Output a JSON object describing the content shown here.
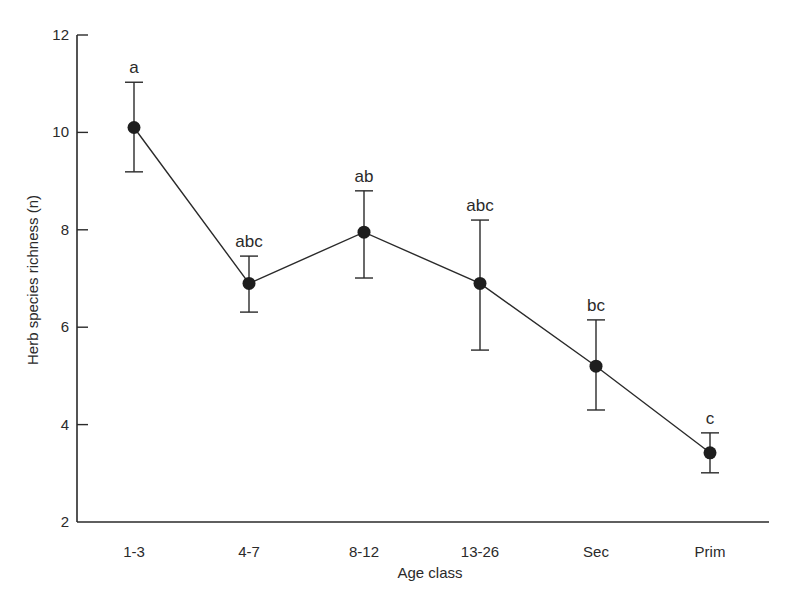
{
  "chart_data": {
    "type": "line",
    "title": "",
    "xlabel": "Age class",
    "ylabel": "Herb species richness (n)",
    "categories": [
      "1-3",
      "4-7",
      "8-12",
      "13-26",
      "Sec",
      "Prim"
    ],
    "series": [
      {
        "name": "Herb species richness",
        "values": [
          10.1,
          6.9,
          7.95,
          6.9,
          5.2,
          3.42
        ],
        "error_upper": [
          11.03,
          7.46,
          8.8,
          8.2,
          6.15,
          3.83
        ],
        "error_lower": [
          9.19,
          6.31,
          7.01,
          5.53,
          4.3,
          3.01
        ],
        "significance_letters": [
          "a",
          "abc",
          "ab",
          "abc",
          "bc",
          "c"
        ],
        "marker": "filled-circle",
        "color": "#1e1e1e"
      }
    ],
    "ylim": [
      2,
      12
    ],
    "yticks": [
      2,
      4,
      6,
      8,
      10,
      12
    ],
    "grid": false,
    "legend": "none"
  },
  "axes": {
    "x_title": "Age class",
    "y_title": "Herb species richness (n)"
  }
}
